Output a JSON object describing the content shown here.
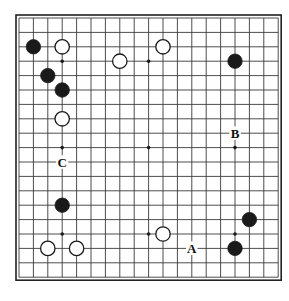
{
  "diagram": {
    "kind": "go-board-diagram",
    "board_size": 19,
    "background_color": "#ffffff",
    "line_color": "#3a3a3a",
    "border_color": "#222222",
    "black_stone_color": "#1a1a1a",
    "white_stone_color": "#ffffff",
    "white_stone_border_color": "#1a1a1a",
    "star_point_color": "#1a1a1a",
    "geometry": {
      "origin_x": 19,
      "origin_y": 18,
      "spacing": 14.4,
      "stone_radius": 7.2,
      "star_radius": 1.8,
      "border_inset": 3
    },
    "star_points": [
      {
        "col": 3,
        "row": 3
      },
      {
        "col": 9,
        "row": 3
      },
      {
        "col": 15,
        "row": 3
      },
      {
        "col": 3,
        "row": 9
      },
      {
        "col": 9,
        "row": 9
      },
      {
        "col": 15,
        "row": 9
      },
      {
        "col": 3,
        "row": 15
      },
      {
        "col": 9,
        "row": 15
      },
      {
        "col": 15,
        "row": 15
      }
    ],
    "stones": [
      {
        "color": "black",
        "col": 1,
        "row": 2
      },
      {
        "color": "white",
        "col": 3,
        "row": 2
      },
      {
        "color": "white",
        "col": 10,
        "row": 2
      },
      {
        "color": "white",
        "col": 7,
        "row": 3
      },
      {
        "color": "black",
        "col": 15,
        "row": 3
      },
      {
        "color": "black",
        "col": 2,
        "row": 4
      },
      {
        "color": "black",
        "col": 3,
        "row": 5
      },
      {
        "color": "white",
        "col": 3,
        "row": 7
      },
      {
        "color": "black",
        "col": 3,
        "row": 13
      },
      {
        "color": "black",
        "col": 16,
        "row": 14
      },
      {
        "color": "white",
        "col": 10,
        "row": 15
      },
      {
        "color": "white",
        "col": 2,
        "row": 16
      },
      {
        "color": "white",
        "col": 4,
        "row": 16
      },
      {
        "color": "black",
        "col": 15,
        "row": 16
      }
    ],
    "labels": [
      {
        "text": "A",
        "col": 12,
        "row": 16
      },
      {
        "text": "B",
        "col": 15,
        "row": 8
      },
      {
        "text": "C",
        "col": 3,
        "row": 10
      }
    ]
  }
}
